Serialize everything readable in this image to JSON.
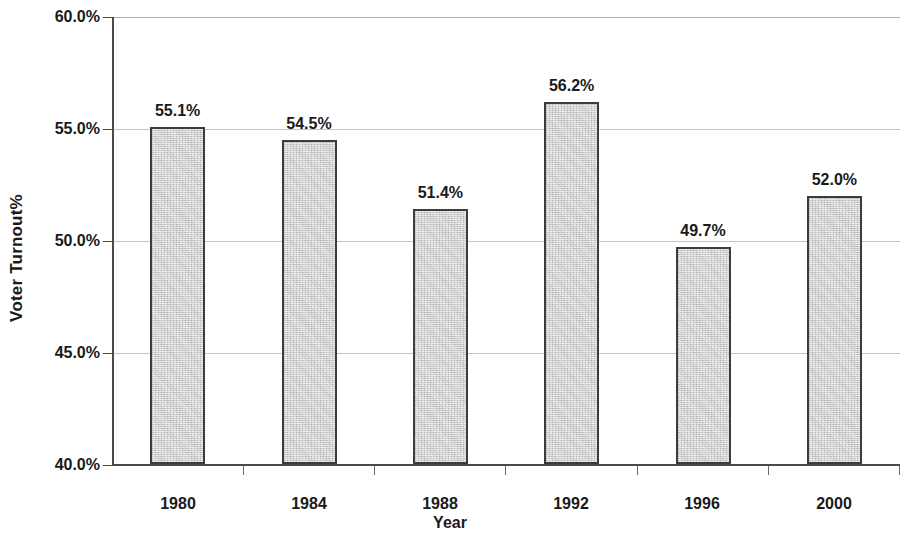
{
  "chart_data": {
    "type": "bar",
    "title": "",
    "xlabel": "Year",
    "ylabel": "Voter Turnout%",
    "categories": [
      "1980",
      "1984",
      "1988",
      "1992",
      "1996",
      "2000"
    ],
    "values": [
      55.1,
      54.5,
      51.4,
      56.2,
      49.7,
      52.0
    ],
    "data_labels": [
      "55.1%",
      "54.5%",
      "51.4%",
      "56.2%",
      "49.7%",
      "52.0%"
    ],
    "ylim": [
      40.0,
      60.0
    ],
    "ytick_values": [
      40.0,
      45.0,
      50.0,
      55.0,
      60.0
    ],
    "ytick_labels": [
      "40.0%",
      "45.0%",
      "50.0%",
      "55.0%",
      "60.0%"
    ],
    "grid": true,
    "legend": "none",
    "bar_fill_color": "#cccccc",
    "bar_border_color": "#3c3c3c",
    "gridline_color": "#c4c4c4",
    "axis_color": "#4a4a4a",
    "text_color": "#1a1a1a",
    "background_color": "#ffffff"
  }
}
